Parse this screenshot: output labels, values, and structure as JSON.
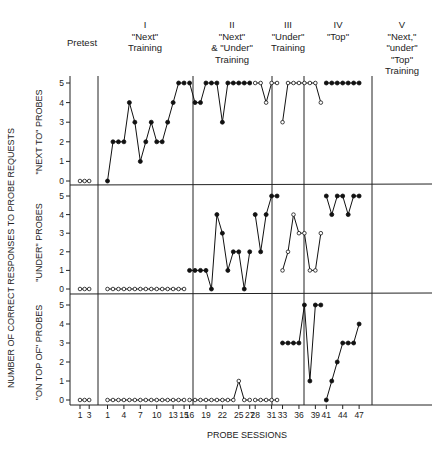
{
  "chart_data": {
    "type": "line",
    "title": "",
    "xlabel": "PROBE SESSIONS",
    "ylabel": "NUMBER OF CORRECT RESPONSES TO PROBE REQUESTS",
    "ylim": [
      0,
      5
    ],
    "grid": false,
    "legend": "none (filled circles = trained probe type, open circles = untrained probe type)",
    "phases": [
      {
        "id": "pretest",
        "label_lines": [
          "Pretest"
        ],
        "sessions": [
          1,
          3
        ]
      },
      {
        "id": "I",
        "label_lines": [
          "I",
          "\"Next\"",
          "Training"
        ],
        "sessions": [
          1,
          15
        ]
      },
      {
        "id": "II",
        "label_lines": [
          "II",
          "\"Next\"",
          "& \"Under\"",
          "Training"
        ],
        "sessions": [
          16,
          27
        ]
      },
      {
        "id": "III",
        "label_lines": [
          "III",
          "\"Under\"",
          "Training"
        ],
        "sessions": [
          28,
          32
        ]
      },
      {
        "id": "IV",
        "label_lines": [
          "IV",
          "\"Top\""
        ],
        "sessions": [
          33,
          40
        ]
      },
      {
        "id": "V",
        "label_lines": [
          "V",
          "\"Next,\"",
          "\"under\"",
          "\"Top\"",
          "Training"
        ],
        "sessions": [
          41,
          47
        ]
      }
    ],
    "x_ticks": {
      "pretest": [
        1,
        3
      ],
      "main": [
        1,
        4,
        7,
        10,
        13,
        15,
        16,
        19,
        22,
        25,
        27,
        28,
        31,
        33,
        36,
        39,
        41,
        44,
        47
      ]
    },
    "y_ticks": [
      0,
      1,
      2,
      3,
      4,
      5
    ],
    "panels": [
      {
        "name": "\"NEXT TO\" PROBES",
        "series": [
          {
            "phase": "pretest",
            "marker": "open",
            "x": [
              1,
              2,
              3
            ],
            "y": [
              0,
              0,
              0
            ]
          },
          {
            "phase": "I",
            "marker": "filled",
            "x": [
              1,
              2,
              3,
              4,
              5,
              6,
              7,
              8,
              9,
              10,
              11,
              12,
              13,
              14,
              15
            ],
            "y": [
              0,
              2,
              2,
              2,
              4,
              3,
              1,
              2,
              3,
              2,
              2,
              3,
              4,
              5,
              5
            ]
          },
          {
            "phase": "II",
            "marker": "filled",
            "x": [
              16,
              17,
              18,
              19,
              20,
              21,
              22,
              23,
              24,
              25,
              26,
              27
            ],
            "y": [
              5,
              4,
              4,
              5,
              5,
              5,
              3,
              5,
              5,
              5,
              5,
              5
            ]
          },
          {
            "phase": "III",
            "marker": "open",
            "x": [
              28,
              29,
              30,
              31,
              32
            ],
            "y": [
              5,
              5,
              4,
              5,
              5
            ]
          },
          {
            "phase": "IV",
            "marker": "open",
            "x": [
              33,
              34,
              35,
              36,
              37,
              38,
              39,
              40
            ],
            "y": [
              3,
              5,
              5,
              5,
              5,
              5,
              5,
              4
            ]
          },
          {
            "phase": "V",
            "marker": "filled",
            "x": [
              41,
              42,
              43,
              44,
              45,
              46,
              47
            ],
            "y": [
              5,
              5,
              5,
              5,
              5,
              5,
              5
            ]
          }
        ]
      },
      {
        "name": "\"UNDER\" PROBES",
        "series": [
          {
            "phase": "pretest",
            "marker": "open",
            "x": [
              1,
              2,
              3
            ],
            "y": [
              0,
              0,
              0
            ]
          },
          {
            "phase": "I",
            "marker": "open",
            "x": [
              1,
              2,
              3,
              4,
              5,
              6,
              7,
              8,
              9,
              10,
              11,
              12,
              13,
              14,
              15
            ],
            "y": [
              0,
              0,
              0,
              0,
              0,
              0,
              0,
              0,
              0,
              0,
              0,
              0,
              0,
              0,
              0
            ]
          },
          {
            "phase": "II",
            "marker": "filled",
            "x": [
              16,
              17,
              18,
              19,
              20,
              21,
              22,
              23,
              24,
              25,
              26,
              27
            ],
            "y": [
              1,
              1,
              1,
              1,
              0,
              4,
              3,
              1,
              2,
              2,
              0,
              2
            ]
          },
          {
            "phase": "III",
            "marker": "filled",
            "x": [
              28,
              29,
              30,
              31,
              32
            ],
            "y": [
              4,
              2,
              4,
              5,
              5
            ]
          },
          {
            "phase": "IV",
            "marker": "open",
            "x": [
              33,
              34,
              35,
              36,
              37,
              38,
              39,
              40
            ],
            "y": [
              1,
              2,
              4,
              3,
              3,
              1,
              1,
              3
            ]
          },
          {
            "phase": "V",
            "marker": "filled",
            "x": [
              41,
              42,
              43,
              44,
              45,
              46,
              47
            ],
            "y": [
              5,
              4,
              5,
              5,
              4,
              5,
              5
            ]
          }
        ]
      },
      {
        "name": "\"ON TOP OF\" PROBES",
        "series": [
          {
            "phase": "pretest",
            "marker": "open",
            "x": [
              1,
              2,
              3
            ],
            "y": [
              0,
              0,
              0
            ]
          },
          {
            "phase": "I",
            "marker": "open",
            "x": [
              1,
              2,
              3,
              4,
              5,
              6,
              7,
              8,
              9,
              10,
              11,
              12,
              13,
              14,
              15
            ],
            "y": [
              0,
              0,
              0,
              0,
              0,
              0,
              0,
              0,
              0,
              0,
              0,
              0,
              0,
              0,
              0
            ]
          },
          {
            "phase": "II",
            "marker": "open",
            "x": [
              16,
              17,
              18,
              19,
              20,
              21,
              22,
              23,
              24,
              25,
              26,
              27
            ],
            "y": [
              0,
              0,
              0,
              0,
              0,
              0,
              0,
              0,
              0,
              1,
              0,
              0
            ]
          },
          {
            "phase": "III",
            "marker": "open",
            "x": [
              28,
              29,
              30,
              31,
              32
            ],
            "y": [
              0,
              0,
              0,
              0,
              0
            ]
          },
          {
            "phase": "IV",
            "marker": "filled",
            "x": [
              33,
              34,
              35,
              36,
              37,
              38,
              39,
              40
            ],
            "y": [
              3,
              3,
              3,
              3,
              5,
              1,
              5,
              5
            ]
          },
          {
            "phase": "V",
            "marker": "filled",
            "x": [
              41,
              42,
              43,
              44,
              45,
              46,
              47
            ],
            "y": [
              0,
              1,
              2,
              3,
              3,
              3,
              4
            ]
          }
        ]
      }
    ]
  },
  "labels": {
    "phase_headers": [
      [
        "Pretest"
      ],
      [
        "I",
        "\"Next\"",
        "Training"
      ],
      [
        "II",
        "\"Next\"",
        "& \"Under\"",
        "Training"
      ],
      [
        "III",
        "\"Under\"",
        "Training"
      ],
      [
        "IV",
        "\"Top\""
      ],
      [
        "V",
        "\"Next,\"",
        "\"under\"",
        "\"Top\"",
        "Training"
      ]
    ],
    "panel_titles": [
      "\"NEXT TO\" PROBES",
      "\"UNDER\" PROBES",
      "\"ON TOP OF\" PROBES"
    ],
    "y_axis_title": "NUMBER OF CORRECT RESPONSES TO PROBE REQUESTS",
    "x_axis_title": "PROBE SESSIONS"
  }
}
